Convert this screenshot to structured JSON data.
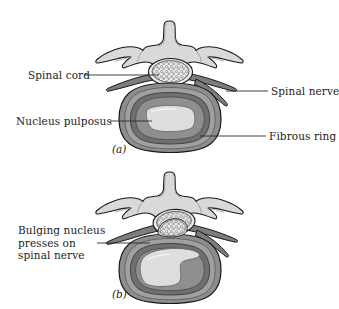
{
  "figure": {
    "panels": [
      {
        "id": "a",
        "caption": "(a)",
        "labels": [
          {
            "name": "spinal-cord",
            "text": "Spinal cord",
            "side": "left"
          },
          {
            "name": "nucleus-pulposus",
            "text": "Nucleus pulposus",
            "side": "left"
          },
          {
            "name": "spinal-nerve",
            "text": "Spinal nerve",
            "side": "right"
          },
          {
            "name": "fibrous-ring",
            "text": "Fibrous ring",
            "side": "right"
          }
        ]
      },
      {
        "id": "b",
        "caption": "(b)",
        "labels": [
          {
            "name": "bulging-nucleus",
            "text": "Bulging nucleus\npresses on\nspinal nerve",
            "line1": "Bulging nucleus",
            "line2": "presses on",
            "line3": "spinal nerve",
            "side": "left"
          }
        ]
      }
    ]
  },
  "colors": {
    "outline": "#1a1a1a",
    "bone_fill": "#d9d9d9",
    "bone_shadow": "#bdbdbd",
    "annulus_outer": "#8a8a8a",
    "annulus_mid": "#a3a3a3",
    "annulus_inner": "#6f6f6f",
    "nucleus_fill": "#dedede",
    "nerve_fill": "#7d7d7d",
    "cord_fill": "#efefef",
    "leader_line": "#2b2b2b",
    "background": "#ffffff"
  },
  "labels_text": {
    "spinal_cord": "Spinal cord",
    "nucleus_pulposus": "Nucleus pulposus",
    "spinal_nerve": "Spinal nerve",
    "fibrous_ring": "Fibrous ring",
    "bulging_line1": "Bulging nucleus",
    "bulging_line2": "presses on",
    "bulging_line3": "spinal nerve",
    "caption_a": "(a)",
    "caption_b": "(b)"
  }
}
